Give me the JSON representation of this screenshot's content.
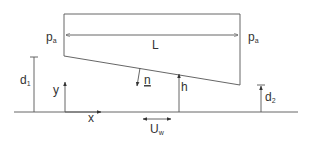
{
  "diagram": {
    "labels": {
      "pressure_left": "p",
      "pressure_left_sub": "a",
      "pressure_right": "p",
      "pressure_right_sub": "a",
      "length": "L",
      "depth_inlet": "d",
      "depth_inlet_sub": "1",
      "depth_outlet": "d",
      "depth_outlet_sub": "2",
      "y_axis": "y",
      "x_axis": "x",
      "normal": "n",
      "gap_height": "h",
      "wall_velocity": "U",
      "wall_velocity_sub": "w"
    },
    "colors": {
      "line": "#555555",
      "text": "#333333",
      "background": "#ffffff"
    }
  }
}
